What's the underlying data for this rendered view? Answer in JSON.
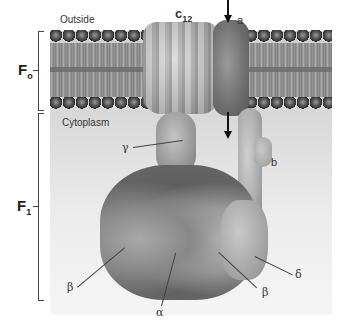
{
  "diagram": {
    "regions": {
      "outside_label": "Outside",
      "cytoplasm_label": "Cytoplasm"
    },
    "brackets": {
      "fo": {
        "label_main": "F",
        "label_sub": "o"
      },
      "f1": {
        "label_main": "F",
        "label_sub": "1"
      }
    },
    "subunits": {
      "c12": {
        "label_main": "c",
        "label_sub": "12"
      },
      "a": {
        "label": "a"
      },
      "gamma": {
        "label": "γ"
      },
      "b": {
        "label": "b"
      },
      "beta_left": {
        "label": "β"
      },
      "alpha": {
        "label": "α"
      },
      "beta_right": {
        "label": "β"
      },
      "delta": {
        "label": "δ"
      }
    },
    "arrows": [
      {
        "name": "proton-inflow-arrow",
        "direction": "down",
        "position": "above membrane at subunit a"
      },
      {
        "name": "proton-outflow-arrow",
        "direction": "down",
        "position": "below membrane into cytoplasm"
      }
    ],
    "colors": {
      "lipid_heads": "#2f2f2f",
      "lipid_tails": "#8a8a8a",
      "c12_ring": "#b3b3b3",
      "f1_core": "#5e5e5e",
      "background_top": "#cfcfcf",
      "background_bottom": "#f5f5f5"
    }
  }
}
